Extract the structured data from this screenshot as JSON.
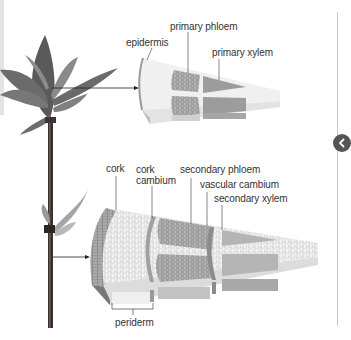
{
  "diagram": {
    "top_section": {
      "labels": {
        "epidermis": "epidermis",
        "primary_phloem": "primary phloem",
        "primary_xylem": "primary xylem"
      }
    },
    "bottom_section": {
      "labels": {
        "cork": "cork",
        "cork_cambium_line1": "cork",
        "cork_cambium_line2": "cambium",
        "secondary_phloem": "secondary phloem",
        "vascular_cambium": "vascular cambium",
        "secondary_xylem": "secondary xylem",
        "periderm": "periderm"
      }
    }
  },
  "navigation": {
    "prev_button_icon": "chevron-left-icon"
  },
  "colors": {
    "label_text": "#333333",
    "leader_line": "#555555",
    "tissue_light": "#efefef",
    "tissue_mid": "#cfcfcf",
    "tissue_dark": "#9a9a9a",
    "nav_button": "#555555"
  }
}
